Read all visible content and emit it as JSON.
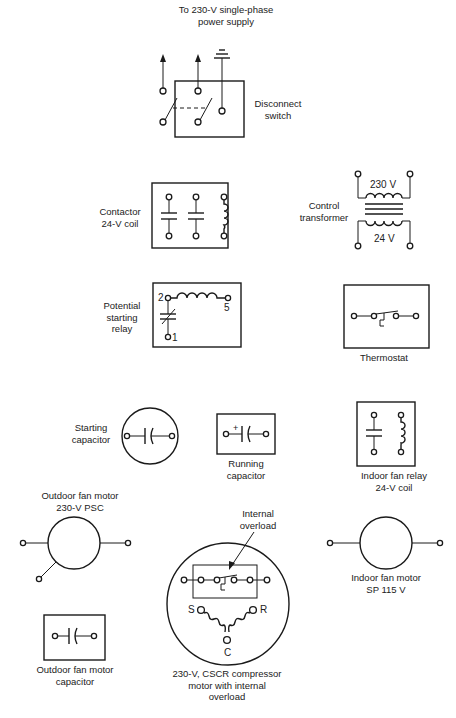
{
  "components": {
    "power_supply": {
      "label_line1": "To 230-V single-phase",
      "label_line2": "power supply"
    },
    "disconnect_switch": {
      "label_line1": "Disconnect",
      "label_line2": "switch"
    },
    "contactor": {
      "label_line1": "Contactor",
      "label_line2": "24-V coil"
    },
    "control_transformer": {
      "label_line1": "Control",
      "label_line2": "transformer",
      "primary_voltage": "230 V",
      "secondary_voltage": "24 V"
    },
    "potential_relay": {
      "label_line1": "Potential",
      "label_line2": "starting",
      "label_line3": "relay",
      "terminal_2": "2",
      "terminal_5": "5",
      "terminal_1": "1"
    },
    "thermostat": {
      "label": "Thermostat"
    },
    "starting_capacitor": {
      "label_line1": "Starting",
      "label_line2": "capacitor"
    },
    "running_capacitor": {
      "label_line1": "Running",
      "label_line2": "capacitor",
      "polarity": "+"
    },
    "indoor_fan_relay": {
      "label_line1": "Indoor fan relay",
      "label_line2": "24-V coil"
    },
    "outdoor_fan_motor": {
      "label_line1": "Outdoor fan motor",
      "label_line2": "230-V PSC"
    },
    "compressor": {
      "overload_line1": "Internal",
      "overload_line2": "overload",
      "terminal_s": "S",
      "terminal_r": "R",
      "terminal_c": "C",
      "label_line1": "230-V, CSCR compressor",
      "label_line2": "motor with internal",
      "label_line3": "overload"
    },
    "indoor_fan_motor": {
      "label_line1": "Indoor fan motor",
      "label_line2": "SP 115 V"
    },
    "outdoor_fan_capacitor": {
      "label_line1": "Outdoor fan motor",
      "label_line2": "capacitor"
    }
  },
  "colors": {
    "ink": "#1a1a1a",
    "background": "#ffffff"
  }
}
